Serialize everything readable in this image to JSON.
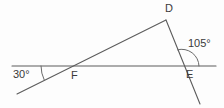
{
  "figure": {
    "type": "geometry-diagram",
    "background_color": "#fdfdfd",
    "line_color": "#5c5c5c",
    "text_color": "#3a3a3a",
    "width": 224,
    "height": 108,
    "vertices": [
      {
        "name": "D",
        "label": "D",
        "x": 166,
        "y": 20,
        "role": "apex"
      },
      {
        "name": "E",
        "label": "E",
        "x": 182,
        "y": 66,
        "role": "intersection-right"
      },
      {
        "name": "F",
        "label": "F",
        "x": 73,
        "y": 66,
        "role": "intersection-left"
      }
    ],
    "angles": [
      {
        "name": "angle-at-F",
        "label": "30°",
        "value": 30,
        "unit": "degrees",
        "vertex": "F",
        "position": {
          "x": 13,
          "y": 69
        },
        "arc": {
          "cx": 73,
          "cy": 66,
          "radius": 32,
          "start_deg": 180,
          "end_deg": 206
        }
      },
      {
        "name": "angle-at-E",
        "label": "105°",
        "value": 105,
        "unit": "degrees",
        "vertex": "E",
        "position": {
          "x": 188,
          "y": 38
        },
        "arc": {
          "cx": 182,
          "cy": 66,
          "radius": 17,
          "start_deg": 0,
          "end_deg": 105
        }
      }
    ],
    "segments": [
      {
        "name": "horizontal-line",
        "x1": 12,
        "y1": 66,
        "x2": 216,
        "y2": 66
      },
      {
        "name": "line-through-F-to-D",
        "x1": 17,
        "y1": 94,
        "x2": 166,
        "y2": 20
      },
      {
        "name": "line-D-through-E",
        "x1": 166,
        "y1": 20,
        "x2": 200,
        "y2": 104
      }
    ]
  }
}
